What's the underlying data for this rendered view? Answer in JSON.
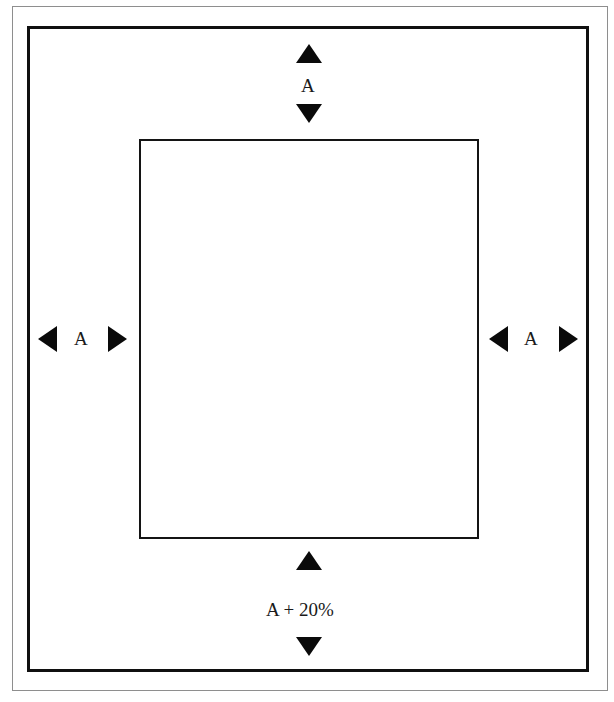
{
  "diagram": {
    "type": "margin-dimension-diagram",
    "background_color": "#ffffff",
    "line_color": "#101010",
    "frames": {
      "outer_scan_border": "thin-rectangle",
      "page_frame": "heavy-rectangle",
      "content_rect": "inner-rectangle"
    },
    "dimensions": {
      "top": {
        "label": "A",
        "arrow_start": "arrow-up-icon",
        "arrow_end": "arrow-down-icon",
        "orientation": "vertical"
      },
      "bottom": {
        "label": "A + 20%",
        "arrow_start": "arrow-up-icon",
        "arrow_end": "arrow-down-icon",
        "orientation": "vertical"
      },
      "left": {
        "label": "A",
        "arrow_start": "arrow-left-icon",
        "arrow_end": "arrow-right-icon",
        "orientation": "horizontal"
      },
      "right": {
        "label": "A",
        "arrow_start": "arrow-left-icon",
        "arrow_end": "arrow-right-icon",
        "orientation": "horizontal"
      }
    }
  }
}
